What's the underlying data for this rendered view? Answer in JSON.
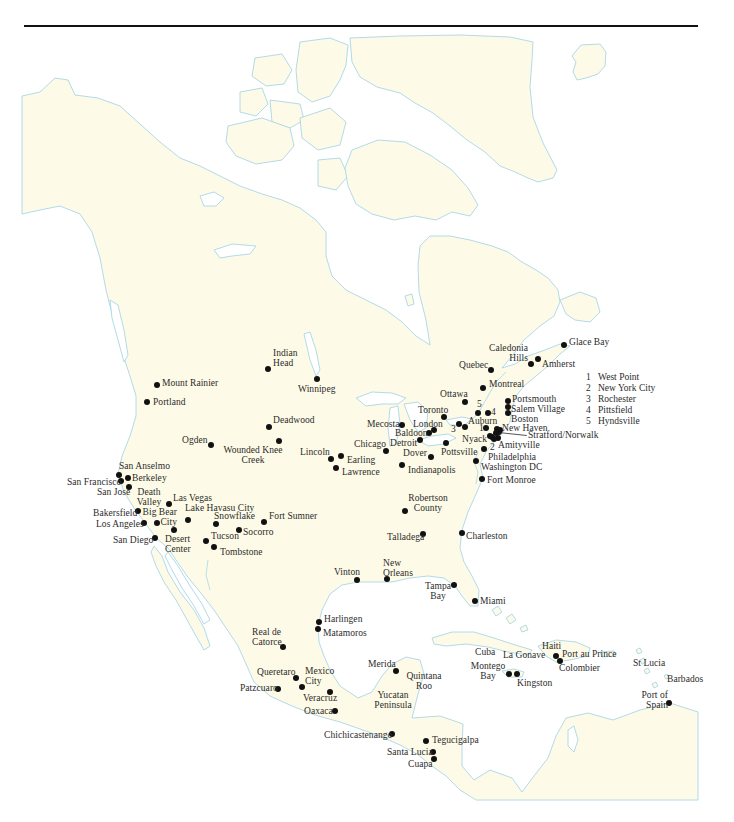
{
  "colors": {
    "land": "#fdfbe7",
    "coast": "#a9d6e8",
    "dot": "#111111",
    "text": "#2b2b2b",
    "rule": "#111111"
  },
  "legend": {
    "items": [
      {
        "num": "1",
        "name": "West Point"
      },
      {
        "num": "2",
        "name": "New York City"
      },
      {
        "num": "3",
        "name": "Rochester"
      },
      {
        "num": "4",
        "name": "Pittsfield"
      },
      {
        "num": "5",
        "name": "Hyndsville"
      }
    ]
  },
  "markers": [
    {
      "num": "1",
      "dot": [
        486,
        428
      ],
      "pos": [
        479,
        423
      ]
    },
    {
      "num": "2",
      "dot": [
        494,
        439
      ],
      "pos": [
        490,
        442
      ]
    },
    {
      "num": "3",
      "dot": [
        459,
        424
      ],
      "pos": [
        451,
        424
      ]
    },
    {
      "num": "4",
      "dot": [
        488,
        413
      ],
      "pos": [
        491,
        407
      ]
    },
    {
      "num": "5",
      "dot": [
        478,
        413
      ],
      "pos": [
        477,
        399
      ]
    }
  ],
  "extra_dots": [
    [
      496,
      433
    ],
    [
      500,
      430
    ],
    [
      492,
      437
    ]
  ],
  "places": [
    {
      "name": "Indian Head",
      "lines": [
        "Indian",
        "Head"
      ],
      "dot": [
        268,
        369
      ],
      "pos": [
        273,
        348
      ],
      "align": "left"
    },
    {
      "name": "Winnipeg",
      "lines": [
        "Winnipeg"
      ],
      "dot": [
        317,
        379
      ],
      "pos": [
        298,
        384
      ],
      "align": "left"
    },
    {
      "name": "Mount Rainier",
      "lines": [
        "Mount Rainier"
      ],
      "dot": [
        157,
        385
      ],
      "pos": [
        162,
        378
      ],
      "align": "left"
    },
    {
      "name": "Portland",
      "lines": [
        "Portland"
      ],
      "dot": [
        147,
        402
      ],
      "pos": [
        153,
        397
      ],
      "align": "left"
    },
    {
      "name": "Deadwood",
      "lines": [
        "Deadwood"
      ],
      "dot": [
        269,
        427
      ],
      "pos": [
        273,
        415
      ],
      "align": "left"
    },
    {
      "name": "Ogden",
      "lines": [
        "Ogden"
      ],
      "dot": [
        211,
        445
      ],
      "pos": [
        182,
        435
      ],
      "align": "left"
    },
    {
      "name": "Wounded Knee Creek",
      "lines": [
        "Wounded Knee",
        "Creek"
      ],
      "dot": [
        279,
        441
      ],
      "pos": [
        253,
        445
      ],
      "align": "center"
    },
    {
      "name": "Lincoln",
      "lines": [
        "Lincoln"
      ],
      "dot": [
        331,
        459
      ],
      "pos": [
        300,
        447
      ],
      "align": "left"
    },
    {
      "name": "Earling",
      "lines": [
        "Earling"
      ],
      "dot": [
        341,
        456
      ],
      "pos": [
        347,
        455
      ],
      "align": "left"
    },
    {
      "name": "Lawrence",
      "lines": [
        "Lawrence"
      ],
      "dot": [
        336,
        468
      ],
      "pos": [
        342,
        467
      ],
      "align": "left"
    },
    {
      "name": "Chicago",
      "lines": [
        "Chicago"
      ],
      "dot": [
        386,
        451
      ],
      "pos": [
        354,
        439
      ],
      "align": "left"
    },
    {
      "name": "Mecosta",
      "lines": [
        "Mecosta"
      ],
      "dot": [
        402,
        425
      ],
      "pos": [
        367,
        419
      ],
      "align": "left"
    },
    {
      "name": "Detroit",
      "lines": [
        "Detroit"
      ],
      "dot": [
        420,
        440
      ],
      "pos": [
        390,
        438
      ],
      "align": "left"
    },
    {
      "name": "Baldoon",
      "lines": [
        "Baldoon"
      ],
      "dot": [
        429,
        433
      ],
      "pos": [
        395,
        428
      ],
      "align": "left"
    },
    {
      "name": "London",
      "lines": [
        "London"
      ],
      "dot": [
        434,
        430
      ],
      "pos": [
        413,
        419
      ],
      "align": "left"
    },
    {
      "name": "Toronto",
      "lines": [
        "Toronto"
      ],
      "dot": [
        444,
        417
      ],
      "pos": [
        418,
        405
      ],
      "align": "left"
    },
    {
      "name": "Ottawa",
      "lines": [
        "Ottawa"
      ],
      "dot": [
        465,
        402
      ],
      "pos": [
        440,
        389
      ],
      "align": "left"
    },
    {
      "name": "Auburn",
      "lines": [
        "Auburn"
      ],
      "dot": [
        465,
        427
      ],
      "pos": [
        468,
        416
      ],
      "align": "left"
    },
    {
      "name": "Dover",
      "lines": [
        "Dover"
      ],
      "dot": [
        431,
        457
      ],
      "pos": [
        403,
        448
      ],
      "align": "left"
    },
    {
      "name": "Pottsville",
      "lines": [
        "Pottsville"
      ],
      "dot": [
        446,
        443
      ],
      "pos": [
        441,
        447
      ],
      "align": "left"
    },
    {
      "name": "Indianapolis",
      "lines": [
        "Indianapolis"
      ],
      "dot": [
        402,
        465
      ],
      "pos": [
        408,
        465
      ],
      "align": "left"
    },
    {
      "name": "Nyack",
      "lines": [
        "Nyack"
      ],
      "dot": [
        490,
        436
      ],
      "pos": [
        462,
        434
      ],
      "align": "left"
    },
    {
      "name": "Amityville",
      "lines": [
        "Amityville"
      ],
      "dot": [
        498,
        438
      ],
      "pos": [
        498,
        440
      ],
      "align": "left"
    },
    {
      "name": "Philadelphia",
      "lines": [
        "Philadelphia"
      ],
      "dot": [
        484,
        449
      ],
      "pos": [
        488,
        452
      ],
      "align": "left"
    },
    {
      "name": "Washington DC",
      "lines": [
        "Washington DC"
      ],
      "dot": [
        476,
        461
      ],
      "pos": [
        481,
        462
      ],
      "align": "left"
    },
    {
      "name": "Fort Monroe",
      "lines": [
        "Fort Monroe"
      ],
      "dot": [
        482,
        479
      ],
      "pos": [
        487,
        475
      ],
      "align": "left"
    },
    {
      "name": "New Haven",
      "lines": [
        "New Haven"
      ],
      "dot": [
        497,
        429
      ],
      "pos": [
        502,
        423
      ],
      "align": "left"
    },
    {
      "name": "Stratford/Norwalk",
      "lines": [
        "Stratford/Norwalk"
      ],
      "dot": [
        499,
        432
      ],
      "pos": [
        528,
        430
      ],
      "align": "left",
      "leader": true
    },
    {
      "name": "Boston",
      "lines": [
        "Boston"
      ],
      "dot": [
        508,
        413
      ],
      "pos": [
        511,
        414
      ],
      "align": "left"
    },
    {
      "name": "Salem Village",
      "lines": [
        "Salem Village"
      ],
      "dot": [
        508,
        407
      ],
      "pos": [
        511,
        404
      ],
      "align": "left"
    },
    {
      "name": "Portsmouth",
      "lines": [
        "Portsmouth"
      ],
      "dot": [
        508,
        401
      ],
      "pos": [
        512,
        394
      ],
      "align": "left"
    },
    {
      "name": "Montreal",
      "lines": [
        "Montreal"
      ],
      "dot": [
        483,
        388
      ],
      "pos": [
        489,
        379
      ],
      "align": "left"
    },
    {
      "name": "Quebec",
      "lines": [
        "Quebec"
      ],
      "dot": [
        491,
        370
      ],
      "pos": [
        459,
        360
      ],
      "align": "left"
    },
    {
      "name": "Caledonia Hills",
      "lines": [
        "Caledonia",
        "Hills"
      ],
      "dot": [
        531,
        364
      ],
      "pos": [
        528,
        343
      ],
      "align": "right"
    },
    {
      "name": "Amherst",
      "lines": [
        "Amherst"
      ],
      "dot": [
        538,
        359
      ],
      "pos": [
        542,
        359
      ],
      "align": "left"
    },
    {
      "name": "Glace Bay",
      "lines": [
        "Glace Bay"
      ],
      "dot": [
        564,
        345
      ],
      "pos": [
        569,
        337
      ],
      "align": "left"
    },
    {
      "name": "Robertson County",
      "lines": [
        "Robertson",
        "County"
      ],
      "dot": [
        405,
        511
      ],
      "pos": [
        428,
        493
      ],
      "align": "center"
    },
    {
      "name": "Talladega",
      "lines": [
        "Talladega"
      ],
      "dot": [
        423,
        534
      ],
      "pos": [
        387,
        532
      ],
      "align": "left"
    },
    {
      "name": "Charleston",
      "lines": [
        "Charleston"
      ],
      "dot": [
        462,
        533
      ],
      "pos": [
        466,
        531
      ],
      "align": "left"
    },
    {
      "name": "San Anselmo",
      "lines": [
        "San Anselmo"
      ],
      "dot": [
        119,
        475
      ],
      "pos": [
        119,
        461
      ],
      "align": "left"
    },
    {
      "name": "Berkeley",
      "lines": [
        "Berkeley"
      ],
      "dot": [
        128,
        478
      ],
      "pos": [
        132,
        473
      ],
      "align": "left"
    },
    {
      "name": "San Francisco",
      "lines": [
        "San Francisco"
      ],
      "dot": [
        121,
        481
      ],
      "pos": [
        67,
        477
      ],
      "align": "left"
    },
    {
      "name": "San Jose",
      "lines": [
        "San Jose"
      ],
      "dot": [
        129,
        487
      ],
      "pos": [
        97,
        487
      ],
      "align": "left"
    },
    {
      "name": "Death Valley",
      "lines": [
        "Death",
        "Valley"
      ],
      "dot": null,
      "pos": [
        149,
        487
      ],
      "align": "center"
    },
    {
      "name": "Las Vegas",
      "lines": [
        "Las Vegas"
      ],
      "dot": [
        169,
        504
      ],
      "pos": [
        173,
        493
      ],
      "align": "left"
    },
    {
      "name": "Lake Havasu City",
      "lines": [
        "Lake Havasu City"
      ],
      "dot": [
        188,
        520
      ],
      "pos": [
        185,
        503
      ],
      "align": "left"
    },
    {
      "name": "Bakersfield",
      "lines": [
        "Bakersfield"
      ],
      "dot": [
        138,
        511
      ],
      "pos": [
        93,
        508
      ],
      "align": "left"
    },
    {
      "name": "Big Bear City",
      "lines": [
        "Big Bear",
        "City"
      ],
      "dot": [
        157,
        523
      ],
      "pos": [
        177,
        507
      ],
      "align": "right"
    },
    {
      "name": "Los Angeles",
      "lines": [
        "Los Angeles"
      ],
      "dot": [
        144,
        523
      ],
      "pos": [
        96,
        519
      ],
      "align": "left"
    },
    {
      "name": "Snowflake",
      "lines": [
        "Snowflake"
      ],
      "dot": [
        216,
        524
      ],
      "pos": [
        214,
        511
      ],
      "align": "left"
    },
    {
      "name": "Fort Sumner",
      "lines": [
        "Fort Sumner"
      ],
      "dot": [
        264,
        522
      ],
      "pos": [
        269,
        511
      ],
      "align": "left"
    },
    {
      "name": "Desert Center",
      "lines": [
        "Desert",
        "Center"
      ],
      "dot": [
        174,
        530
      ],
      "pos": [
        165,
        534
      ],
      "align": "left"
    },
    {
      "name": "San Diego",
      "lines": [
        "San Diego"
      ],
      "dot": [
        155,
        538
      ],
      "pos": [
        113,
        535
      ],
      "align": "left"
    },
    {
      "name": "Socorro",
      "lines": [
        "Socorro"
      ],
      "dot": [
        239,
        530
      ],
      "pos": [
        243,
        527
      ],
      "align": "left"
    },
    {
      "name": "Tucson",
      "lines": [
        "Tucson"
      ],
      "dot": [
        206,
        541
      ],
      "pos": [
        211,
        531
      ],
      "align": "left"
    },
    {
      "name": "Tombstone",
      "lines": [
        "Tombstone"
      ],
      "dot": [
        214,
        547
      ],
      "pos": [
        220,
        547
      ],
      "align": "left"
    },
    {
      "name": "Vinton",
      "lines": [
        "Vinton"
      ],
      "dot": [
        357,
        580
      ],
      "pos": [
        334,
        567
      ],
      "align": "left"
    },
    {
      "name": "New Orleans",
      "lines": [
        "New",
        "Orleans"
      ],
      "dot": [
        387,
        579
      ],
      "pos": [
        383,
        558
      ],
      "align": "left"
    },
    {
      "name": "Tampa Bay",
      "lines": [
        "Tampa",
        "Bay"
      ],
      "dot": [
        454,
        585
      ],
      "pos": [
        438,
        581
      ],
      "align": "center"
    },
    {
      "name": "Miami",
      "lines": [
        "Miami"
      ],
      "dot": [
        475,
        601
      ],
      "pos": [
        480,
        596
      ],
      "align": "left"
    },
    {
      "name": "Harlingen",
      "lines": [
        "Harlingen"
      ],
      "dot": [
        319,
        622
      ],
      "pos": [
        324,
        614
      ],
      "align": "left"
    },
    {
      "name": "Matamoros",
      "lines": [
        "Matamoros"
      ],
      "dot": [
        318,
        629
      ],
      "pos": [
        323,
        628
      ],
      "align": "left"
    },
    {
      "name": "Real de Catorce",
      "lines": [
        "Real de",
        "Catorce"
      ],
      "dot": [
        283,
        647
      ],
      "pos": [
        252,
        627
      ],
      "align": "left"
    },
    {
      "name": "Queretaro",
      "lines": [
        "Queretaro"
      ],
      "dot": [
        296,
        678
      ],
      "pos": [
        257,
        667
      ],
      "align": "left"
    },
    {
      "name": "Mexico City",
      "lines": [
        "Mexico",
        "City"
      ],
      "dot": [
        302,
        687
      ],
      "pos": [
        305,
        666
      ],
      "align": "left"
    },
    {
      "name": "Patzcuaro",
      "lines": [
        "Patzcuaro"
      ],
      "dot": [
        278,
        689
      ],
      "pos": [
        240,
        683
      ],
      "align": "left"
    },
    {
      "name": "Veracruz",
      "lines": [
        "Veracruz"
      ],
      "dot": [
        330,
        692
      ],
      "pos": [
        303,
        693
      ],
      "align": "left"
    },
    {
      "name": "Oaxaca",
      "lines": [
        "Oaxaca"
      ],
      "dot": [
        335,
        711
      ],
      "pos": [
        304,
        706
      ],
      "align": "left"
    },
    {
      "name": "Merida",
      "lines": [
        "Merida"
      ],
      "dot": [
        396,
        671
      ],
      "pos": [
        368,
        659
      ],
      "align": "left"
    },
    {
      "name": "Quintana Roo",
      "lines": [
        "Quintana",
        "Roo"
      ],
      "dot": null,
      "pos": [
        424,
        671
      ],
      "align": "center"
    },
    {
      "name": "Yucatan Peninsula",
      "lines": [
        "Yucatan",
        "Peninsula"
      ],
      "dot": null,
      "pos": [
        393,
        690
      ],
      "align": "center"
    },
    {
      "name": "Chichicastenango",
      "lines": [
        "Chichicastenango"
      ],
      "dot": [
        392,
        734
      ],
      "pos": [
        324,
        730
      ],
      "align": "left"
    },
    {
      "name": "Tegucigalpa",
      "lines": [
        "Tegucigalpa"
      ],
      "dot": [
        426,
        741
      ],
      "pos": [
        432,
        735
      ],
      "align": "left"
    },
    {
      "name": "Santa Lucia",
      "lines": [
        "Santa Lucia"
      ],
      "dot": [
        433,
        752
      ],
      "pos": [
        387,
        747
      ],
      "align": "left"
    },
    {
      "name": "Cuapa",
      "lines": [
        "Cuapa"
      ],
      "dot": [
        434,
        759
      ],
      "pos": [
        408,
        759
      ],
      "align": "left"
    },
    {
      "name": "Cuba",
      "lines": [
        "Cuba"
      ],
      "dot": null,
      "pos": [
        475,
        647
      ],
      "align": "left"
    },
    {
      "name": "La Gonave",
      "lines": [
        "La Gonave"
      ],
      "dot": null,
      "pos": [
        503,
        650
      ],
      "align": "left"
    },
    {
      "name": "Haiti",
      "lines": [
        "Haiti"
      ],
      "dot": null,
      "pos": [
        542,
        641
      ],
      "align": "left"
    },
    {
      "name": "Port au Prince",
      "lines": [
        "Port au Prince"
      ],
      "dot": [
        556,
        656
      ],
      "pos": [
        562,
        649
      ],
      "align": "left"
    },
    {
      "name": "Colombier",
      "lines": [
        "Colombier"
      ],
      "dot": [
        560,
        661
      ],
      "pos": [
        559,
        663
      ],
      "align": "left"
    },
    {
      "name": "Montego Bay",
      "lines": [
        "Montego",
        "Bay"
      ],
      "dot": [
        509,
        674
      ],
      "pos": [
        488,
        661
      ],
      "align": "center"
    },
    {
      "name": "Kingston",
      "lines": [
        "Kingston"
      ],
      "dot": [
        517,
        674
      ],
      "pos": [
        517,
        678
      ],
      "align": "left"
    },
    {
      "name": "St Lucia",
      "lines": [
        "St Lucia"
      ],
      "dot": null,
      "pos": [
        633,
        658
      ],
      "align": "left"
    },
    {
      "name": "Barbados",
      "lines": [
        "Barbados"
      ],
      "dot": null,
      "pos": [
        667,
        674
      ],
      "align": "left"
    },
    {
      "name": "Port of Spain",
      "lines": [
        "Port of",
        "Spain"
      ],
      "dot": [
        669,
        703
      ],
      "pos": [
        668,
        690
      ],
      "align": "right"
    }
  ]
}
